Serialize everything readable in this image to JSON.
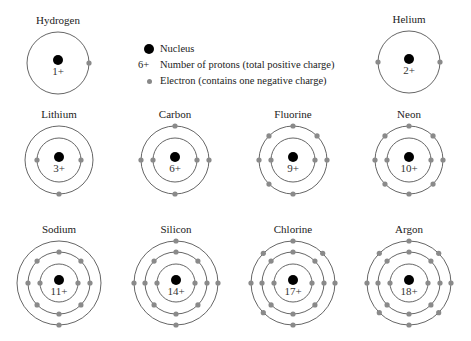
{
  "legend": {
    "nucleus_label": "Nucleus",
    "protons_symbol": "6+",
    "protons_label": "Number of protons (total positive charge)",
    "electron_label": "Electron (contains one negative charge)"
  },
  "colors": {
    "nucleus": "#000000",
    "electron": "#8a8a8a",
    "shell": "#555555"
  },
  "atoms": [
    {
      "name": "Hydrogen",
      "charge": "1+",
      "cx": 58,
      "cy": 63,
      "shells": [
        1
      ],
      "radii": [
        31
      ],
      "electron_angles": [
        [
          0
        ]
      ]
    },
    {
      "name": "Helium",
      "charge": "2+",
      "cx": 409,
      "cy": 62,
      "shells": [
        2
      ],
      "radii": [
        31
      ],
      "electron_angles": [
        [
          0,
          180
        ]
      ]
    },
    {
      "name": "Lithium",
      "charge": "3+",
      "cx": 59,
      "cy": 160,
      "shells": [
        2,
        1
      ],
      "radii": [
        22,
        34
      ],
      "electron_angles": [
        [
          0,
          180
        ],
        [
          270
        ]
      ]
    },
    {
      "name": "Carbon",
      "charge": "6+",
      "cx": 175,
      "cy": 160,
      "shells": [
        2,
        4
      ],
      "radii": [
        22,
        34
      ],
      "electron_angles": [
        [
          0,
          180
        ],
        [
          0,
          90,
          180,
          270
        ]
      ]
    },
    {
      "name": "Fluorine",
      "charge": "9+",
      "cx": 293,
      "cy": 160,
      "shells": [
        2,
        7
      ],
      "radii": [
        22,
        34
      ],
      "electron_angles": [
        [
          0,
          180
        ],
        [
          0,
          45,
          90,
          135,
          180,
          225,
          270
        ]
      ]
    },
    {
      "name": "Neon",
      "charge": "10+",
      "cx": 409,
      "cy": 160,
      "shells": [
        2,
        8
      ],
      "radii": [
        22,
        34
      ],
      "electron_angles": [
        [
          0,
          180
        ],
        [
          0,
          45,
          90,
          135,
          180,
          225,
          270,
          315
        ]
      ]
    },
    {
      "name": "Sodium",
      "charge": "11+",
      "cx": 59,
      "cy": 283,
      "shells": [
        2,
        8,
        1
      ],
      "radii": [
        19,
        31,
        42
      ],
      "electron_angles": [
        [
          0,
          180
        ],
        [
          0,
          45,
          90,
          135,
          180,
          225,
          270,
          315
        ],
        [
          270
        ]
      ]
    },
    {
      "name": "Silicon",
      "charge": "14+",
      "cx": 176,
      "cy": 283,
      "shells": [
        2,
        8,
        4
      ],
      "radii": [
        19,
        31,
        42
      ],
      "electron_angles": [
        [
          0,
          180
        ],
        [
          0,
          45,
          90,
          135,
          180,
          225,
          270,
          315
        ],
        [
          0,
          90,
          180,
          270
        ]
      ]
    },
    {
      "name": "Chlorine",
      "charge": "17+",
      "cx": 293,
      "cy": 283,
      "shells": [
        2,
        8,
        7
      ],
      "radii": [
        19,
        31,
        42
      ],
      "electron_angles": [
        [
          0,
          180
        ],
        [
          0,
          45,
          90,
          135,
          180,
          225,
          270,
          315
        ],
        [
          0,
          45,
          90,
          135,
          180,
          225,
          270
        ]
      ]
    },
    {
      "name": "Argon",
      "charge": "18+",
      "cx": 409,
      "cy": 283,
      "shells": [
        2,
        8,
        8
      ],
      "radii": [
        19,
        31,
        42
      ],
      "electron_angles": [
        [
          0,
          180
        ],
        [
          0,
          45,
          90,
          135,
          180,
          225,
          270,
          315
        ],
        [
          0,
          45,
          90,
          135,
          180,
          225,
          270,
          315
        ]
      ]
    }
  ]
}
